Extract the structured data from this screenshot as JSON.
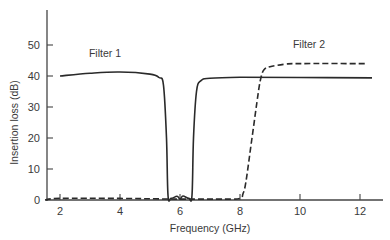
{
  "chart_data": {
    "type": "line",
    "title": "",
    "xlabel": "Frequency (GHz)",
    "ylabel": "Insertion loss (dB)",
    "xlim": [
      1.5,
      12.7
    ],
    "ylim": [
      0,
      62
    ],
    "xticks": [
      2,
      4,
      6,
      8,
      10,
      12
    ],
    "yticks": [
      0,
      10,
      20,
      30,
      40,
      50
    ],
    "grid": false,
    "legend": "inline annotations",
    "annotations": [
      {
        "text": "Filter 1",
        "x": 3.5,
        "y": 46
      },
      {
        "text": "Filter 2",
        "x": 10.3,
        "y": 49
      }
    ],
    "series": [
      {
        "name": "Filter 1",
        "style": "solid",
        "x": [
          2,
          3,
          4,
          5,
          5.3,
          5.45,
          5.55,
          5.6,
          5.7,
          5.9,
          6.0,
          6.1,
          6.3,
          6.4,
          6.45,
          6.55,
          6.7,
          7.0,
          8,
          10,
          12.4
        ],
        "y": [
          40,
          40.9,
          41.3,
          40.6,
          39.5,
          37,
          20,
          1.5,
          0.5,
          1.2,
          0.3,
          1.3,
          0.5,
          1.5,
          20,
          35,
          38.5,
          39.3,
          39.6,
          39.5,
          39.4
        ]
      },
      {
        "name": "Filter 2",
        "style": "dashed",
        "x": [
          1.5,
          2,
          4,
          6,
          7.5,
          8.0,
          8.1,
          8.2,
          8.4,
          8.6,
          8.7,
          8.8,
          9.0,
          9.5,
          10,
          12.2
        ],
        "y": [
          0,
          0.5,
          0.5,
          0.3,
          0.3,
          0.5,
          2,
          6,
          20,
          34,
          39.5,
          42,
          43,
          43.8,
          44,
          44
        ]
      }
    ]
  }
}
